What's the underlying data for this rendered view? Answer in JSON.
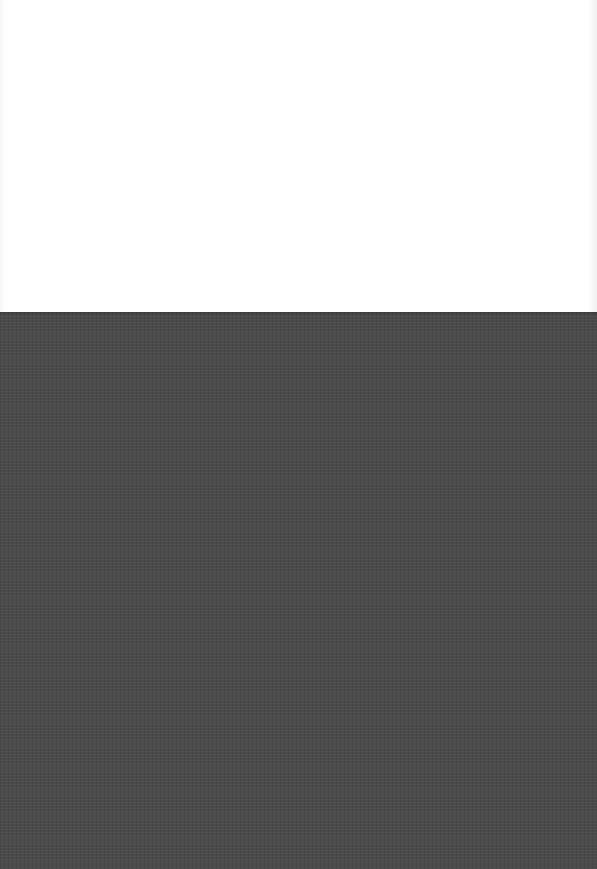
{
  "scene": {
    "description": "Blank white sheet of paper resting on a dark gray textured surface",
    "colors": {
      "paper": "#ffffff",
      "surface": "#4b4b4b"
    }
  }
}
